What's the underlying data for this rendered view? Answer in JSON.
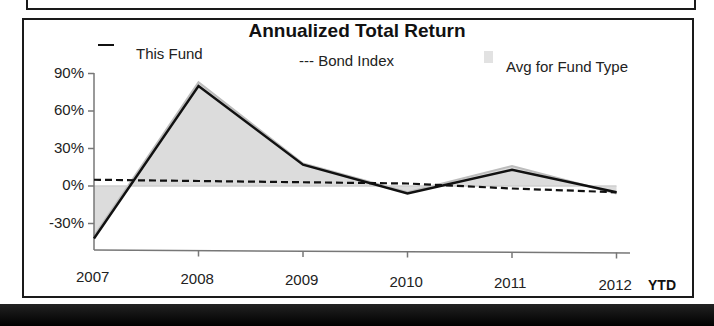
{
  "chart_data": {
    "type": "line",
    "title": "Annualized Total Return",
    "categories": [
      "2007",
      "2008",
      "2009",
      "2010",
      "2011",
      "2012"
    ],
    "x_suffix_label": "YTD",
    "series": [
      {
        "name": "This Fund",
        "style": "solid",
        "values": [
          -42,
          80,
          17,
          -6,
          13,
          -5
        ]
      },
      {
        "name": "Bond Index",
        "style": "dashed",
        "values": [
          5,
          4,
          3,
          2,
          -2,
          -5
        ]
      },
      {
        "name": "Avg for Fund Type",
        "style": "area",
        "values": [
          -40,
          83,
          18,
          -5,
          16,
          -6
        ]
      }
    ],
    "ytick_labels": [
      "90%",
      "60%",
      "30%",
      "0%",
      "-30%"
    ],
    "yticks": [
      90,
      60,
      30,
      0,
      -30
    ],
    "ylim": [
      -50,
      90
    ],
    "xlabel": "",
    "ylabel": "",
    "grid": false,
    "legend_position": "top"
  },
  "legend": {
    "fund": "This Fund",
    "bond": "--- Bond Index",
    "avg": "Avg for Fund Type"
  },
  "colors": {
    "fund": "#111111",
    "bond": "#111111",
    "avg_fill": "#dcdcdc",
    "avg_line": "#bdbdbd"
  }
}
